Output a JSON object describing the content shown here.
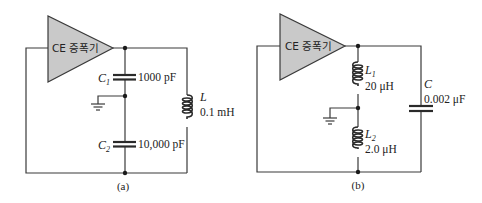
{
  "figure": {
    "panels": [
      {
        "id": "a",
        "caption": "(a)",
        "amplifier": {
          "label": "CE 증폭기"
        },
        "components": [
          {
            "type": "capacitor",
            "name": "C",
            "sub": "1",
            "value": "1000 pF"
          },
          {
            "type": "capacitor",
            "name": "C",
            "sub": "2",
            "value": "10,000 pF"
          },
          {
            "type": "inductor",
            "name": "L",
            "sub": "",
            "value": "0.1 mH"
          }
        ],
        "ground": "ground-icon"
      },
      {
        "id": "b",
        "caption": "(b)",
        "amplifier": {
          "label": "CE 증폭기"
        },
        "components": [
          {
            "type": "inductor",
            "name": "L",
            "sub": "1",
            "value": "20 μH"
          },
          {
            "type": "inductor",
            "name": "L",
            "sub": "2",
            "value": "2.0 μH"
          },
          {
            "type": "capacitor",
            "name": "C",
            "sub": "",
            "value": "0.002 μF"
          }
        ],
        "ground": "ground-icon"
      }
    ],
    "colors": {
      "amplifier_fill": "#c9c9c9",
      "wire": "#3a3a3a"
    }
  }
}
